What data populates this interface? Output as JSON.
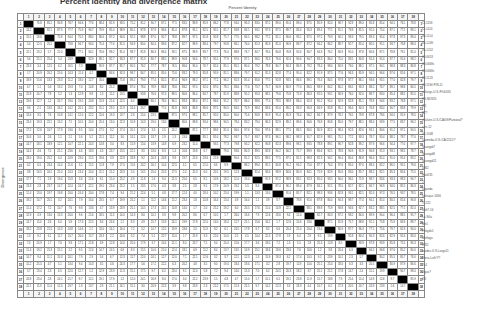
{
  "figure": {
    "title": "Percent identity and divergence matrix",
    "top_axis_label": "Percent Identity",
    "side_axis_label": "Divergence",
    "size": 38
  },
  "row_labels": [
    "CI-1158",
    "CI-1124",
    "06-1114",
    "06-1249",
    "06-1252",
    "09-0653",
    "09-0669c",
    "09-0669c",
    "09-1123",
    "09-1190 PIN-11",
    "virlungs-U.S./F54/431",
    "K9-NDS35",
    "ZI1",
    "B7?",
    "chicken-U.S./CA/09/Pantanal?",
    "cjzs-12",
    "06-1048",
    "Ujameba-U.S./CA/2111/?",
    "Guangdi7",
    "Guangdi8",
    "Guangdi11",
    "4862",
    "Hut4/35",
    "J",
    "Uganda",
    "vaksajur-1466",
    "IT-222",
    "Nkh?-16",
    "La Silla",
    "Mn1",
    "Fnkgds5",
    "Metlega",
    "IPS2",
    "ravdes-U.S.Largo11",
    "Stera-Luth?/?",
    "Tu1",
    "Jiguo?",
    "ZJI"
  ],
  "header_numbers": [
    1,
    2,
    3,
    4,
    5,
    6,
    7,
    8,
    9,
    10,
    11,
    12,
    13,
    14,
    15,
    16,
    17,
    18,
    19,
    20,
    21,
    22,
    23,
    24,
    25,
    26,
    27,
    28,
    29,
    30,
    31,
    32,
    33,
    34,
    35,
    36,
    37,
    38
  ]
}
